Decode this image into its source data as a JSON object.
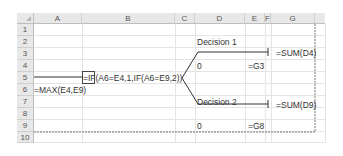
{
  "spreadsheet": {
    "columns": [
      "A",
      "B",
      "C",
      "D",
      "E",
      "F",
      "G"
    ],
    "rows": [
      "1",
      "2",
      "3",
      "4",
      "5",
      "6",
      "7",
      "8",
      "9",
      "10"
    ],
    "cells": {
      "D2": "Decision 1",
      "G3": "=SUM(D4)",
      "D4": "0",
      "E4": "=G3",
      "B5": "=IF(A6=E4,1,IF(A6=E9,2))",
      "A6": "=MAX(E4,E9)",
      "D7": "Decision 2",
      "G8": "=SUM(D9)",
      "D9": "0",
      "E9": "=G8"
    }
  }
}
